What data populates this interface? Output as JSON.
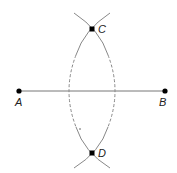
{
  "diagram": {
    "points": [
      {
        "id": "A",
        "label": "A",
        "x": 19,
        "y": 91
      },
      {
        "id": "B",
        "label": "B",
        "x": 165,
        "y": 91
      },
      {
        "id": "C",
        "label": "C",
        "x": 92,
        "y": 29
      },
      {
        "id": "D",
        "label": "D",
        "x": 92,
        "y": 153
      }
    ],
    "segment": {
      "from": "A",
      "to": "B"
    },
    "colors": {
      "line": "#777777",
      "point": "#000000",
      "label": "#222222"
    }
  }
}
